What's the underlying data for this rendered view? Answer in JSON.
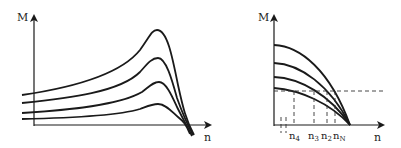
{
  "diagrams": [
    {
      "id": "left",
      "y_axis_label": "M",
      "x_axis_label": "n",
      "description": "Torque–speed curves with peak (breakdown torque) converging at synchronous speed; four curves of increasing peak"
    },
    {
      "id": "right",
      "y_axis_label": "M",
      "x_axis_label": "n",
      "tick_labels": [
        "n",
        "n",
        "n",
        "n"
      ],
      "tick_subscripts": [
        "4",
        "3",
        "2",
        "N"
      ],
      "description": "Four falling torque–speed curves converging at one point; dashed horizontal load line intersects curves at n4, n3, n2, nN"
    }
  ],
  "colors": {
    "line": "#1a1a1a",
    "dash": "#333333",
    "background": "#ffffff"
  }
}
